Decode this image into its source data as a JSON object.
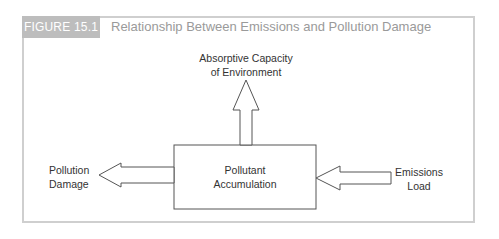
{
  "figure": {
    "label": "FIGURE 15.1",
    "title": "Relationship Between Emissions and Pollution Damage"
  },
  "diagram": {
    "nodes": {
      "center": {
        "line1": "Pollutant",
        "line2": "Accumulation"
      },
      "top": {
        "line1": "Absorptive Capacity",
        "line2": "of Environment"
      },
      "left": {
        "line1": "Pollution",
        "line2": "Damage"
      },
      "right": {
        "line1": "Emissions",
        "line2": "Load"
      }
    },
    "edges": [
      {
        "from": "Emissions Load",
        "to": "Pollutant Accumulation"
      },
      {
        "from": "Pollutant Accumulation",
        "to": "Absorptive Capacity of Environment"
      },
      {
        "from": "Pollutant Accumulation",
        "to": "Pollution Damage"
      }
    ],
    "colors": {
      "frame": "#cfcfcf",
      "label_bg": "#bdbdbd",
      "title": "#9a9a9a",
      "stroke": "#555555"
    }
  }
}
